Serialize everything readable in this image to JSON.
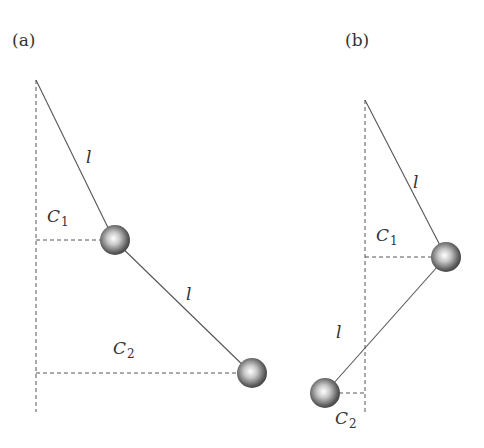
{
  "panels": [
    {
      "id": "a",
      "label": "(a)",
      "rod1_label": "l",
      "rod2_label": "l",
      "c1_label": "C",
      "c1_sub": "1",
      "c2_label": "C",
      "c2_sub": "2"
    },
    {
      "id": "b",
      "label": "(b)",
      "rod1_label": "l",
      "rod2_label": "l",
      "c1_label": "C",
      "c1_sub": "1",
      "c2_label": "C",
      "c2_sub": "2"
    }
  ],
  "colors": {
    "line": "#555555",
    "dashed": "#555555",
    "text": "#333333"
  }
}
